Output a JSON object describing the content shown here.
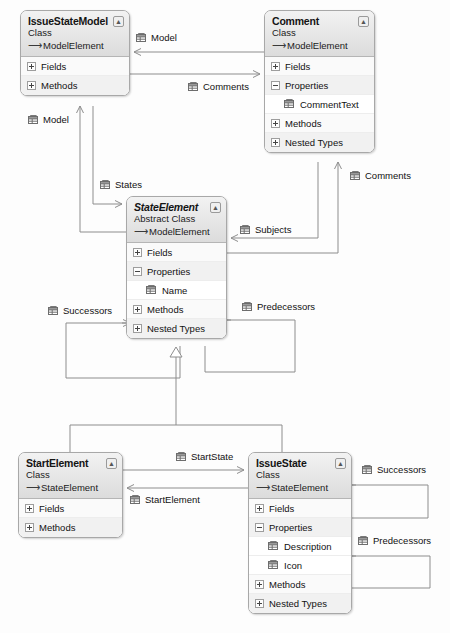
{
  "diagram": {
    "type": "uml-class-diagram"
  },
  "icons": {
    "collapse": "collapse-icon",
    "property": "property-icon",
    "inherit_arrow": "→"
  },
  "classes": [
    {
      "id": "issuestatemodel",
      "name": "IssueStateModel",
      "kind": "Class",
      "base": "ModelElement",
      "abstract": false,
      "x": 20,
      "y": 10,
      "w": 110,
      "sections": [
        {
          "label": "Fields",
          "expanded": false,
          "members": []
        },
        {
          "label": "Methods",
          "expanded": false,
          "members": []
        }
      ]
    },
    {
      "id": "comment",
      "name": "Comment",
      "kind": "Class",
      "base": "ModelElement",
      "abstract": false,
      "x": 264,
      "y": 10,
      "w": 111,
      "sections": [
        {
          "label": "Fields",
          "expanded": false,
          "members": []
        },
        {
          "label": "Properties",
          "expanded": true,
          "members": [
            "CommentText"
          ]
        },
        {
          "label": "Methods",
          "expanded": false,
          "members": []
        },
        {
          "label": "Nested Types",
          "expanded": false,
          "members": []
        }
      ]
    },
    {
      "id": "stateelement",
      "name": "StateElement",
      "kind": "Abstract Class",
      "base": "ModelElement",
      "abstract": true,
      "x": 126,
      "y": 196,
      "w": 101,
      "sections": [
        {
          "label": "Fields",
          "expanded": false,
          "members": []
        },
        {
          "label": "Properties",
          "expanded": true,
          "members": [
            "Name"
          ]
        },
        {
          "label": "Methods",
          "expanded": false,
          "members": []
        },
        {
          "label": "Nested Types",
          "expanded": false,
          "members": []
        }
      ]
    },
    {
      "id": "startelement",
      "name": "StartElement",
      "kind": "Class",
      "base": "StateElement",
      "abstract": false,
      "x": 18,
      "y": 452,
      "w": 105,
      "sections": [
        {
          "label": "Fields",
          "expanded": false,
          "members": []
        },
        {
          "label": "Methods",
          "expanded": false,
          "members": []
        }
      ]
    },
    {
      "id": "issuestate",
      "name": "IssueState",
      "kind": "Class",
      "base": "StateElement",
      "abstract": false,
      "x": 248,
      "y": 452,
      "w": 104,
      "sections": [
        {
          "label": "Fields",
          "expanded": false,
          "members": []
        },
        {
          "label": "Properties",
          "expanded": true,
          "members": [
            "Description",
            "Icon"
          ]
        },
        {
          "label": "Methods",
          "expanded": false,
          "members": []
        },
        {
          "label": "Nested Types",
          "expanded": false,
          "members": []
        }
      ]
    }
  ],
  "edge_labels": [
    {
      "id": "model-top",
      "text": "Model",
      "x": 136,
      "y": 32
    },
    {
      "id": "comments-top",
      "text": "Comments",
      "x": 188,
      "y": 81
    },
    {
      "id": "model-left",
      "text": "Model",
      "x": 28,
      "y": 114
    },
    {
      "id": "states",
      "text": "States",
      "x": 100,
      "y": 179
    },
    {
      "id": "comments-right",
      "text": "Comments",
      "x": 350,
      "y": 170
    },
    {
      "id": "subjects",
      "text": "Subjects",
      "x": 240,
      "y": 224
    },
    {
      "id": "successors-mid",
      "text": "Successors",
      "x": 48,
      "y": 305
    },
    {
      "id": "predecessors-mid",
      "text": "Predecessors",
      "x": 242,
      "y": 301
    },
    {
      "id": "startstate",
      "text": "StartState",
      "x": 176,
      "y": 451
    },
    {
      "id": "startelement",
      "text": "StartElement",
      "x": 130,
      "y": 494
    },
    {
      "id": "successors-rt",
      "text": "Successors",
      "x": 362,
      "y": 464
    },
    {
      "id": "predecessors-rt",
      "text": "Predecessors",
      "x": 358,
      "y": 535
    }
  ],
  "connections": [
    {
      "from": "comment",
      "to": "issuestatemodel",
      "label": "Model",
      "kind": "association"
    },
    {
      "from": "issuestatemodel",
      "to": "comment",
      "label": "Comments",
      "kind": "association"
    },
    {
      "from": "stateelement",
      "to": "issuestatemodel",
      "label": "Model",
      "kind": "association"
    },
    {
      "from": "issuestatemodel",
      "to": "stateelement",
      "label": "States",
      "kind": "association"
    },
    {
      "from": "stateelement",
      "to": "comment",
      "label": "Comments",
      "kind": "association"
    },
    {
      "from": "comment",
      "to": "stateelement",
      "label": "Subjects",
      "kind": "association"
    },
    {
      "from": "stateelement",
      "to": "stateelement",
      "label": "Successors",
      "kind": "association"
    },
    {
      "from": "stateelement",
      "to": "stateelement",
      "label": "Predecessors",
      "kind": "association"
    },
    {
      "from": "startelement",
      "to": "stateelement",
      "label": "",
      "kind": "inheritance"
    },
    {
      "from": "issuestate",
      "to": "stateelement",
      "label": "",
      "kind": "inheritance"
    },
    {
      "from": "startelement",
      "to": "issuestate",
      "label": "StartState",
      "kind": "association"
    },
    {
      "from": "issuestate",
      "to": "startelement",
      "label": "StartElement",
      "kind": "association"
    },
    {
      "from": "issuestate",
      "to": "issuestate",
      "label": "Successors",
      "kind": "association"
    },
    {
      "from": "issuestate",
      "to": "issuestate",
      "label": "Predecessors",
      "kind": "association"
    }
  ],
  "colors": {
    "line": "#8d8d8d",
    "box_border": "#a8a8a8",
    "header_top": "#f2f2f2",
    "header_bottom": "#dcdcdc",
    "row_bg": "#fafafa",
    "row_alt_bg": "#f1f1f1",
    "text": "#111111"
  }
}
